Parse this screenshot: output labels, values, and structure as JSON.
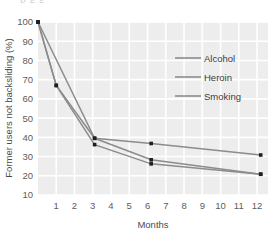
{
  "top_clipped_text": "p g g",
  "chart_data": {
    "type": "line",
    "title": "",
    "xlabel": "Months",
    "ylabel": "Former users not backsliding (%)",
    "xlim": [
      0,
      12.6
    ],
    "ylim": [
      10,
      100
    ],
    "xticks": [
      1,
      2,
      3,
      4,
      5,
      6,
      7,
      8,
      9,
      10,
      11,
      12
    ],
    "xtick_labels": [
      "1",
      "2",
      "3",
      "4",
      "5",
      "6",
      "7",
      "8",
      "9",
      "10",
      "11",
      "12"
    ],
    "yticks": [
      10,
      20,
      30,
      40,
      50,
      60,
      70,
      80,
      90,
      100
    ],
    "ytick_labels": [
      "10",
      "20",
      "30",
      "40",
      "50",
      "60",
      "70",
      "80",
      "90",
      "100"
    ],
    "grid": true,
    "grid_color": "#ffffff",
    "plot_background": "#ededed",
    "legend_position": "upper-right",
    "marker": "square",
    "marker_color": "#1f1f1f",
    "line_color": "#8c8c8c",
    "series": [
      {
        "name": "Alcohol",
        "x": [
          0,
          3.1,
          6.2,
          12.2
        ],
        "values": [
          100,
          39.5,
          36.8,
          30.8
        ]
      },
      {
        "name": "Heroin",
        "x": [
          0,
          1,
          3.1,
          6.2,
          12.2
        ],
        "values": [
          100,
          67,
          39.5,
          28.3,
          20.8
        ]
      },
      {
        "name": "Smoking",
        "x": [
          0,
          1,
          3.1,
          6.2,
          12.2
        ],
        "values": [
          100,
          67,
          36.2,
          26.2,
          20.8
        ]
      }
    ]
  },
  "legend": {
    "entries": [
      {
        "label": "Alcohol"
      },
      {
        "label": "Heroin"
      },
      {
        "label": "Smoking"
      }
    ]
  }
}
